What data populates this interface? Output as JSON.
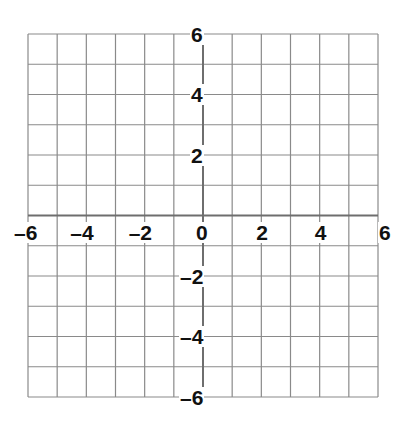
{
  "chart_data": {
    "type": "scatter",
    "title": "",
    "xlabel": "",
    "ylabel": "",
    "xlim": [
      -6,
      6
    ],
    "ylim": [
      -6,
      6
    ],
    "grid": true,
    "grid_step": 1,
    "x_tick_labels": [
      "-6",
      "-4",
      "-2",
      "0",
      "2",
      "4",
      "6"
    ],
    "x_ticks": [
      -6,
      -4,
      -2,
      0,
      2,
      4,
      6
    ],
    "y_tick_labels": [
      "6",
      "4",
      "2",
      "-2",
      "-4",
      "-6"
    ],
    "y_ticks": [
      6,
      4,
      2,
      -2,
      -4,
      -6
    ],
    "series": [],
    "legend": null
  },
  "colors": {
    "grid_line": "#8a8a8a",
    "axis_line": "#6e6e6e",
    "label": "#111111",
    "background": "#ffffff"
  },
  "layout": {
    "left": 28,
    "top": 34,
    "right": 378,
    "bottom": 397
  }
}
